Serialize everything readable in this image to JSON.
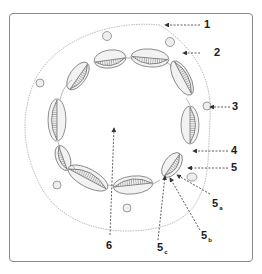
{
  "diagram": {
    "type": "stem cross-section",
    "stroke_color": "#555555",
    "hatch_color": "#8a8a8a",
    "labels": [
      {
        "id": "1",
        "text": "1",
        "sub": ""
      },
      {
        "id": "2",
        "text": "2",
        "sub": ""
      },
      {
        "id": "3",
        "text": "3",
        "sub": ""
      },
      {
        "id": "4",
        "text": "4",
        "sub": ""
      },
      {
        "id": "5",
        "text": "5",
        "sub": ""
      },
      {
        "id": "5a",
        "text": "5",
        "sub": "a"
      },
      {
        "id": "5b",
        "text": "5",
        "sub": "b"
      },
      {
        "id": "5c",
        "text": "5",
        "sub": "c"
      },
      {
        "id": "6",
        "text": "6",
        "sub": ""
      }
    ]
  }
}
